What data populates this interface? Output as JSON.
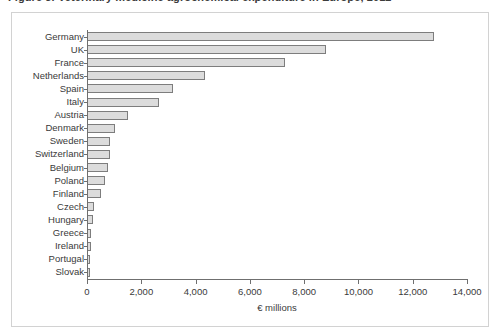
{
  "caption": {
    "text": "Figure 3. Veterinary medicine agrochemical expenditure in Europe, 2012"
  },
  "chart_data": {
    "type": "bar",
    "orientation": "horizontal",
    "title": "Veterinary medicine agrochemical expenditure in Europe, 2012",
    "xlabel": "€ millions",
    "ylabel": "",
    "xlim": [
      0,
      14000
    ],
    "xticks": [
      0,
      2000,
      4000,
      6000,
      8000,
      10000,
      12000,
      14000
    ],
    "xtick_labels": [
      "0",
      "2,000",
      "4,000",
      "6,000",
      "8,000",
      "10,000",
      "12,000",
      "14,000"
    ],
    "grid": false,
    "legend": false,
    "bar_fill": "#dcdcdc",
    "bar_edge": "#7d7d7d",
    "categories": [
      "Germany",
      "UK",
      "France",
      "Netherlands",
      "Spain",
      "Italy",
      "Austria",
      "Denmark",
      "Sweden",
      "Switzerland",
      "Belgium",
      "Poland",
      "Finland",
      "Czech",
      "Hungary",
      "Greece",
      "Ireland",
      "Portugal",
      "Slovak"
    ],
    "values": [
      12800,
      8800,
      7300,
      4350,
      3150,
      2650,
      1500,
      1030,
      860,
      830,
      780,
      680,
      520,
      250,
      210,
      160,
      140,
      110,
      90
    ]
  }
}
